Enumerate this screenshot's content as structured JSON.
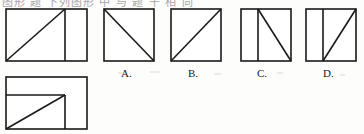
{
  "page": {
    "width": 364,
    "height": 134,
    "background_color": "#fdfdfc",
    "ink_color": "#1a1a1a",
    "header_fragment": "图形 题 下列图形 中 与 题 干 相 同"
  },
  "question": {
    "stem_figure": {
      "name": "stem-figure",
      "shape": "rectangle",
      "description": "Rectangle with an interior vertical line and a diagonal from the bottom-left corner up to the top of the vertical line",
      "x": 5,
      "y": 8,
      "width": 83,
      "height": 54,
      "vertical_divider_x_fraction": 0.72,
      "diagonal": "bottom-left to top of vertical divider"
    },
    "second_figure": {
      "name": "stem-figure-2",
      "shape": "rectangle",
      "description": "Rectangle with an interior horizontal line and vertical line forming an inner rectangle, plus a diagonal from the bottom-left corner to their intersection",
      "x": 5,
      "y": 76,
      "width": 83,
      "height": 54,
      "horizontal_divider_y_fraction": 0.35,
      "vertical_divider_x_fraction": 0.72,
      "diagonal": "bottom-left to intersection of dividers"
    }
  },
  "options": [
    {
      "id": "A",
      "label": "A.",
      "x": 103,
      "y": 8,
      "size": 52,
      "label_x": 121,
      "label_y": 68,
      "shape": "square",
      "divider": "none",
      "diagonal": "top-left to bottom-right",
      "description": "Square with a single diagonal running from the top-left corner down to the bottom-right corner"
    },
    {
      "id": "B",
      "label": "B.",
      "x": 170,
      "y": 8,
      "size": 52,
      "label_x": 188,
      "label_y": 68,
      "shape": "square",
      "divider": "none",
      "diagonal": "bottom-left to top-right",
      "description": "Square with a single diagonal running from the bottom-left corner up to the top-right corner"
    },
    {
      "id": "C",
      "label": "C.",
      "x": 240,
      "y": 8,
      "size": 52,
      "label_x": 257,
      "label_y": 68,
      "shape": "square",
      "divider": "vertical",
      "divider_x_fraction": 0.34,
      "diagonal": "top of vertical divider to bottom-right corner",
      "description": "Square with a vertical line about one third from the left and a diagonal from the top of that line to the bottom-right corner"
    },
    {
      "id": "D",
      "label": "D.",
      "x": 305,
      "y": 8,
      "size": 52,
      "label_x": 323,
      "label_y": 68,
      "shape": "square",
      "divider": "vertical",
      "divider_x_fraction": 0.34,
      "diagonal": "bottom of vertical divider to top-right corner",
      "description": "Square with a vertical line about one third from the left and a diagonal from the bottom of that line up to the top-right corner"
    }
  ]
}
